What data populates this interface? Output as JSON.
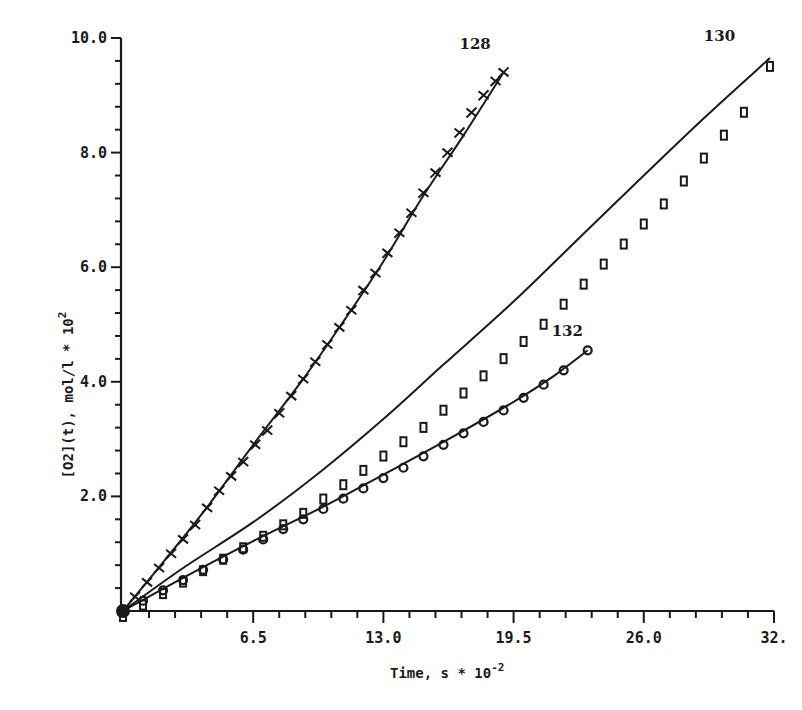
{
  "chart_data": {
    "type": "scatter",
    "title": "",
    "xlabel": "Time, s * 10^-2",
    "ylabel": "[O2](t), mol/l * 10^2",
    "xlim": [
      0,
      32.5
    ],
    "ylim": [
      0,
      10.0
    ],
    "x_ticks": [
      0,
      6.5,
      13.0,
      19.5,
      26.0,
      32.5
    ],
    "x_tick_labels": [
      "6.5",
      "13.0",
      "19.5",
      "26.0",
      "32."
    ],
    "x_minor_step": 1.3,
    "y_ticks": [
      2.0,
      4.0,
      6.0,
      8.0,
      10.0
    ],
    "y_tick_labels": [
      "2.0",
      "4.0",
      "6.0",
      "8.0",
      "10.0"
    ],
    "y_minor_step": 0.4,
    "grid": false,
    "legend": "inline curve labels",
    "series": [
      {
        "name": "128",
        "marker": "plus",
        "fit_line": true,
        "x": [
          0,
          0.6,
          1.2,
          1.8,
          2.4,
          3.0,
          3.6,
          4.2,
          4.8,
          5.4,
          6.0,
          6.6,
          7.2,
          7.8,
          8.4,
          9.0,
          9.6,
          10.2,
          10.8,
          11.4,
          12.0,
          12.6,
          13.2,
          13.8,
          14.4,
          15.0,
          15.6,
          16.2,
          16.8,
          17.4,
          18.0,
          18.6,
          19.0
        ],
        "values": [
          0,
          0.25,
          0.5,
          0.75,
          1.0,
          1.25,
          1.5,
          1.8,
          2.1,
          2.35,
          2.6,
          2.9,
          3.15,
          3.45,
          3.75,
          4.05,
          4.35,
          4.65,
          4.95,
          5.25,
          5.6,
          5.9,
          6.25,
          6.6,
          6.95,
          7.3,
          7.65,
          8.0,
          8.35,
          8.7,
          9.0,
          9.25,
          9.4
        ]
      },
      {
        "name": "130",
        "marker": "square",
        "fit_line": true,
        "x": [
          0,
          1.0,
          2.0,
          3.0,
          4.0,
          5.0,
          6.0,
          7.0,
          8.0,
          9.0,
          10.0,
          11.0,
          12.0,
          13.0,
          14.0,
          15.0,
          16.0,
          17.0,
          18.0,
          19.0,
          20.0,
          21.0,
          22.0,
          23.0,
          24.0,
          25.0,
          26.0,
          27.0,
          28.0,
          29.0,
          30.0,
          31.0,
          32.3
        ],
        "values": [
          0,
          0.2,
          0.4,
          0.6,
          0.8,
          1.0,
          1.2,
          1.4,
          1.6,
          1.8,
          2.05,
          2.3,
          2.55,
          2.8,
          3.05,
          3.3,
          3.6,
          3.9,
          4.2,
          4.5,
          4.8,
          5.1,
          5.45,
          5.8,
          6.15,
          6.5,
          6.85,
          7.2,
          7.6,
          8.0,
          8.4,
          8.8,
          9.6
        ]
      },
      {
        "name": "132",
        "marker": "circle",
        "fit_line": true,
        "x": [
          0,
          1.0,
          2.0,
          3.0,
          4.0,
          5.0,
          6.0,
          7.0,
          8.0,
          9.0,
          10.0,
          11.0,
          12.0,
          13.0,
          14.0,
          15.0,
          16.0,
          17.0,
          18.0,
          19.0,
          20.0,
          21.0,
          22.0,
          23.2
        ],
        "values": [
          0,
          0.18,
          0.36,
          0.54,
          0.72,
          0.9,
          1.07,
          1.25,
          1.43,
          1.6,
          1.78,
          1.96,
          2.14,
          2.32,
          2.5,
          2.7,
          2.9,
          3.1,
          3.3,
          3.5,
          3.72,
          3.95,
          4.2,
          4.55
        ]
      }
    ],
    "fit_curves": {
      "128": [
        [
          0,
          0
        ],
        [
          2,
          0.85
        ],
        [
          4,
          1.72
        ],
        [
          6.5,
          2.9
        ],
        [
          9,
          4.05
        ],
        [
          11,
          5.05
        ],
        [
          13,
          6.1
        ],
        [
          15,
          7.25
        ],
        [
          17,
          8.3
        ],
        [
          19,
          9.4
        ]
      ],
      "130": [
        [
          0,
          0
        ],
        [
          3,
          0.75
        ],
        [
          6.5,
          1.55
        ],
        [
          9.75,
          2.4
        ],
        [
          13,
          3.35
        ],
        [
          16,
          4.3
        ],
        [
          19.5,
          5.4
        ],
        [
          22.75,
          6.5
        ],
        [
          26,
          7.6
        ],
        [
          29,
          8.6
        ],
        [
          32.3,
          9.65
        ]
      ],
      "132": [
        [
          0,
          0
        ],
        [
          3,
          0.58
        ],
        [
          6.5,
          1.22
        ],
        [
          10,
          1.82
        ],
        [
          13,
          2.38
        ],
        [
          16,
          2.95
        ],
        [
          19.5,
          3.65
        ],
        [
          21.5,
          4.1
        ],
        [
          23.2,
          4.55
        ]
      ]
    },
    "annotations": [
      {
        "text": "128",
        "x": 16.8,
        "y": 9.8
      },
      {
        "text": "130",
        "x": 29.0,
        "y": 9.95
      },
      {
        "text": "132",
        "x": 21.4,
        "y": 4.8
      }
    ]
  }
}
